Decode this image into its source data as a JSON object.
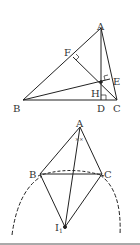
{
  "figure1": {
    "labels": {
      "A": "A",
      "B": "B",
      "C": "C",
      "D": "D",
      "E": "E",
      "F": "F",
      "H": "H"
    },
    "points": {
      "A": [
        101,
        28
      ],
      "B": [
        23,
        100
      ],
      "C": [
        117,
        100
      ],
      "D": [
        101,
        100
      ],
      "E": [
        110,
        79
      ],
      "F": [
        73,
        57
      ],
      "H": [
        101,
        82
      ]
    }
  },
  "figure2": {
    "labels": {
      "A": "A",
      "B": "B",
      "C": "C",
      "I": "I",
      "I_sub": "1"
    },
    "points": {
      "A": [
        80,
        127
      ],
      "B": [
        40,
        174
      ],
      "C": [
        102,
        174
      ],
      "I1": [
        65,
        227
      ]
    }
  },
  "colors": {
    "line": "#222222",
    "text": "#333333",
    "dash": "#444444"
  }
}
